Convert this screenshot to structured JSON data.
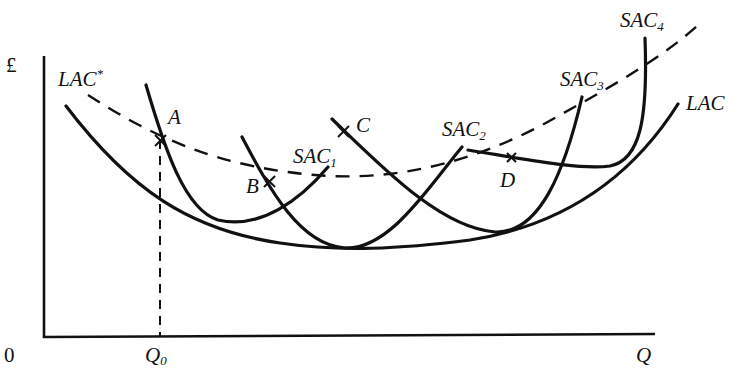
{
  "diagram": {
    "axes": {
      "y_label": "£",
      "x_label": "Q",
      "origin_label": "0",
      "x_tick_label": "Q",
      "x_tick_sub": "0"
    },
    "curves": {
      "lac": "LAC",
      "lac_star": "LAC",
      "lac_star_sup": "*",
      "sac1": "SAC",
      "sac1_sub": "1",
      "sac2": "SAC",
      "sac2_sub": "2",
      "sac3": "SAC",
      "sac3_sub": "3",
      "sac4": "SAC",
      "sac4_sub": "4"
    },
    "points": {
      "a": "A",
      "b": "B",
      "c": "C",
      "d": "D"
    },
    "colors": {
      "ink": "#111111",
      "background": "#ffffff"
    }
  }
}
